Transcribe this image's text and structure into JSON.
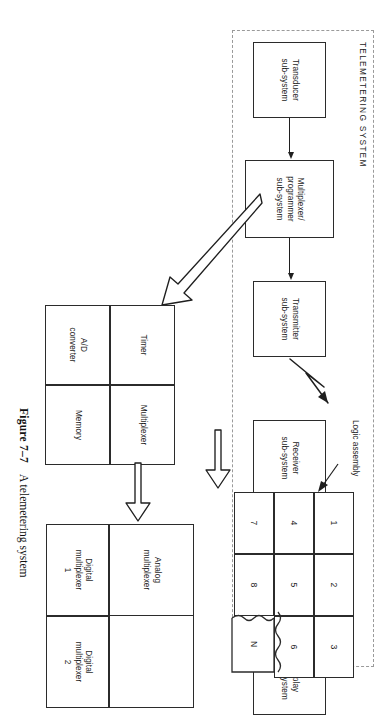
{
  "figure": {
    "number": "Figure 7–7",
    "caption": "A telemetering system"
  },
  "enclosure": {
    "label": "TELEMETERING SYSTEM"
  },
  "top_chain": {
    "blocks": [
      {
        "id": "transducer",
        "lines": [
          "Transducer",
          "sub-system"
        ]
      },
      {
        "id": "multiplexer-programmer",
        "lines": [
          "Multiplexer/",
          "programmer",
          "sub-system"
        ]
      },
      {
        "id": "transmitter",
        "lines": [
          "Transmitter",
          "sub-system"
        ]
      },
      {
        "id": "receiver",
        "lines": [
          "Receiver",
          "sub-system"
        ]
      },
      {
        "id": "demultiplexer-decoder",
        "lines": [
          "Demultiplexer/",
          "decoder",
          "sub-system"
        ]
      },
      {
        "id": "display",
        "lines": [
          "Display",
          "sub-system"
        ]
      }
    ]
  },
  "lower_detail": {
    "front_end": {
      "cells": [
        {
          "id": "timer",
          "lines": [
            "Timer"
          ]
        },
        {
          "id": "multiplexer",
          "lines": [
            "Multiplexer"
          ]
        },
        {
          "id": "ad-converter",
          "lines": [
            "A/D",
            "converter"
          ]
        },
        {
          "id": "memory",
          "lines": [
            "Memory"
          ]
        }
      ]
    },
    "mux_stack": {
      "analog": {
        "id": "analog-multiplexer",
        "lines": [
          "Analog",
          "multiplexer"
        ]
      },
      "digital": [
        {
          "id": "digital-multiplexer-1",
          "lines": [
            "Digital",
            "multiplexer",
            "1"
          ]
        },
        {
          "id": "digital-multiplexer-2",
          "lines": [
            "Digital",
            "multiplexer",
            "2"
          ]
        }
      ]
    },
    "logic_assembly": {
      "label_lines": [
        "Logic",
        "assembly"
      ],
      "rows": [
        [
          "1",
          "2",
          "3"
        ],
        [
          "4",
          "5",
          "6"
        ],
        [
          "7",
          "8",
          "N"
        ]
      ],
      "torn_cell": "N"
    }
  },
  "colors": {
    "stroke": "#2b2b2b",
    "dashed": "#9a9a9a",
    "text": "#1c1c1c",
    "background": "#ffffff"
  }
}
